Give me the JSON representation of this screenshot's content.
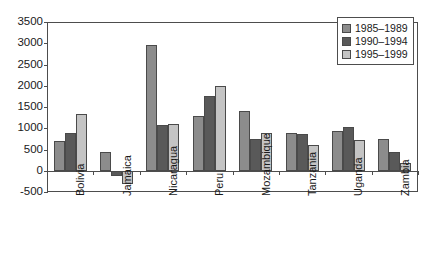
{
  "chart_data": {
    "type": "bar",
    "title": "",
    "xlabel": "",
    "ylabel": "",
    "ylim": [
      -500,
      3500
    ],
    "ytick_step": 500,
    "yticks": [
      "3500",
      "3000",
      "2500",
      "2000",
      "1500",
      "1000",
      "500",
      "0",
      "-500"
    ],
    "grid": false,
    "legend_position": "top-right",
    "categories": [
      "Bolivia",
      "Jamaica",
      "Nicaragua",
      "Peru",
      "Mozambique",
      "Tanzania",
      "Uganda",
      "Zambia"
    ],
    "series": [
      {
        "name": "1985–1989",
        "color": "#8c8c8c",
        "values": [
          700,
          450,
          2950,
          1300,
          1400,
          880,
          930,
          750
        ]
      },
      {
        "name": "1990–1994",
        "color": "#595959",
        "values": [
          900,
          -130,
          1080,
          1750,
          750,
          870,
          1020,
          430
        ]
      },
      {
        "name": "1995–1999",
        "color": "#c4c4c4",
        "values": [
          1330,
          -310,
          1100,
          2000,
          880,
          600,
          730,
          180
        ]
      }
    ]
  },
  "legend": {
    "items": [
      {
        "label": "1985–1989"
      },
      {
        "label": "1990–1994"
      },
      {
        "label": "1995–1999"
      }
    ]
  }
}
